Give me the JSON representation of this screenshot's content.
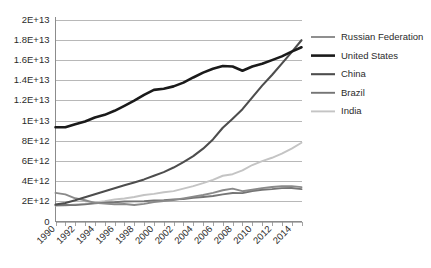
{
  "chart_data": {
    "type": "line",
    "title": "",
    "subtitle": "",
    "xlabel": "",
    "ylabel": "",
    "grid": "horizontal",
    "legend_position": "right",
    "xlim": [
      1990,
      2015
    ],
    "ylim": [
      0,
      20000000000000
    ],
    "x": [
      1990,
      1991,
      1992,
      1993,
      1994,
      1995,
      1996,
      1997,
      1998,
      1999,
      2000,
      2001,
      2002,
      2003,
      2004,
      2005,
      2006,
      2007,
      2008,
      2009,
      2010,
      2011,
      2012,
      2013,
      2014,
      2015
    ],
    "xtick_labels": [
      "1990",
      "1992",
      "1994",
      "1996",
      "1998",
      "2000",
      "2002",
      "2004",
      "2006",
      "2008",
      "2010",
      "2012",
      "2014"
    ],
    "xtick_values": [
      1990,
      1992,
      1994,
      1996,
      1998,
      2000,
      2002,
      2004,
      2006,
      2008,
      2010,
      2012,
      2014
    ],
    "ytick_labels": [
      "0",
      "2E+12",
      "4E+12",
      "6E+12",
      "8E+12",
      "1E+13",
      "1.2E+13",
      "1.4E+13",
      "1.6E+13",
      "1.8E+13",
      "2E+13"
    ],
    "ytick_values": [
      0,
      2000000000000,
      4000000000000,
      6000000000000,
      8000000000000,
      10000000000000,
      12000000000000,
      14000000000000,
      16000000000000,
      18000000000000,
      20000000000000
    ],
    "series": [
      {
        "name": "Russian Federation",
        "color": "#8a8a8a",
        "width": 1.9,
        "values": [
          2830000000000,
          2690000000000,
          2300000000000,
          2100000000000,
          1840000000000,
          1770000000000,
          1710000000000,
          1730000000000,
          1640000000000,
          1750000000000,
          1930000000000,
          2030000000000,
          2130000000000,
          2290000000000,
          2460000000000,
          2620000000000,
          2840000000000,
          3090000000000,
          3250000000000,
          3000000000000,
          3150000000000,
          3300000000000,
          3420000000000,
          3490000000000,
          3500000000000,
          3400000000000
        ]
      },
      {
        "name": "United States",
        "color": "#1a1a1a",
        "width": 2.6,
        "values": [
          9330000000000,
          9330000000000,
          9640000000000,
          9900000000000,
          10300000000000,
          10560000000000,
          10960000000000,
          11450000000000,
          11960000000000,
          12530000000000,
          13030000000000,
          13150000000000,
          13380000000000,
          13750000000000,
          14260000000000,
          14740000000000,
          15130000000000,
          15390000000000,
          15340000000000,
          14930000000000,
          15350000000000,
          15610000000000,
          15980000000000,
          16350000000000,
          16820000000000,
          17250000000000
        ]
      },
      {
        "name": "China",
        "color": "#4d4d4d",
        "width": 2.1,
        "values": [
          1690000000000,
          1840000000000,
          2100000000000,
          2390000000000,
          2700000000000,
          2990000000000,
          3290000000000,
          3590000000000,
          3870000000000,
          4170000000000,
          4520000000000,
          4890000000000,
          5340000000000,
          5880000000000,
          6480000000000,
          7210000000000,
          8130000000000,
          9280000000000,
          10180000000000,
          11120000000000,
          12290000000000,
          13450000000000,
          14500000000000,
          15630000000000,
          16770000000000,
          17950000000000
        ]
      },
      {
        "name": "Brazil",
        "color": "#757575",
        "width": 1.9,
        "values": [
          1610000000000,
          1630000000000,
          1620000000000,
          1700000000000,
          1790000000000,
          1870000000000,
          1910000000000,
          1980000000000,
          1990000000000,
          2000000000000,
          2090000000000,
          2120000000000,
          2190000000000,
          2220000000000,
          2350000000000,
          2430000000000,
          2530000000000,
          2680000000000,
          2820000000000,
          2810000000000,
          3020000000000,
          3150000000000,
          3210000000000,
          3300000000000,
          3320000000000,
          3210000000000
        ]
      },
      {
        "name": "India",
        "color": "#c4c4c4",
        "width": 1.9,
        "values": [
          1570000000000,
          1590000000000,
          1680000000000,
          1770000000000,
          1890000000000,
          2020000000000,
          2180000000000,
          2280000000000,
          2430000000000,
          2620000000000,
          2740000000000,
          2890000000000,
          3010000000000,
          3250000000000,
          3510000000000,
          3800000000000,
          4120000000000,
          4530000000000,
          4680000000000,
          5060000000000,
          5590000000000,
          5980000000000,
          6310000000000,
          6720000000000,
          7220000000000,
          7800000000000
        ]
      }
    ]
  },
  "legend": {
    "items": [
      {
        "label": "Russian Federation"
      },
      {
        "label": "United States"
      },
      {
        "label": "China"
      },
      {
        "label": "Brazil"
      },
      {
        "label": "India"
      }
    ]
  }
}
